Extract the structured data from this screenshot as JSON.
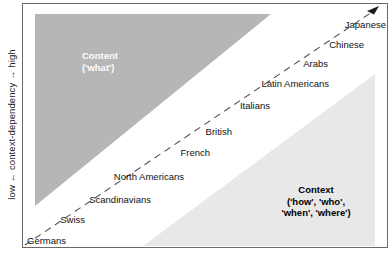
{
  "figure": {
    "y_axis_label": "low ← context-dependency → high",
    "arrow_icon": "arrow-up-right-icon"
  },
  "regions": [
    {
      "key": "content",
      "name": "content-region",
      "text": "Content\n('what')",
      "fill": "#b6b6b6",
      "text_color": "#ffffff"
    },
    {
      "key": "context",
      "name": "context-region",
      "text": "Context\n('how', 'who',\n'when', 'where')",
      "fill": "#e8e8e8",
      "text_color": "#000000"
    }
  ],
  "chart_data": {
    "type": "scatter",
    "title": "",
    "xlabel": "",
    "ylabel": "low ← context-dependency → high",
    "grid": false,
    "legend": "none",
    "series": [
      {
        "name": "cultures",
        "points": [
          {
            "label": "Germans",
            "x": 0.02,
            "y": 0.03
          },
          {
            "label": "Swiss",
            "x": 0.13,
            "y": 0.12
          },
          {
            "label": "Scandinavians",
            "x": 0.24,
            "y": 0.22
          },
          {
            "label": "North Americans",
            "x": 0.37,
            "y": 0.33
          },
          {
            "label": "French",
            "x": 0.49,
            "y": 0.43
          },
          {
            "label": "British",
            "x": 0.57,
            "y": 0.5
          },
          {
            "label": "Italians",
            "x": 0.66,
            "y": 0.6
          },
          {
            "label": "Latin Americans",
            "x": 0.76,
            "y": 0.7
          },
          {
            "label": "Arabs",
            "x": 0.84,
            "y": 0.79
          },
          {
            "label": "Chinese",
            "x": 0.9,
            "y": 0.86
          },
          {
            "label": "Japanese",
            "x": 0.96,
            "y": 0.93
          }
        ]
      }
    ]
  },
  "culture_points": [
    {
      "label": "Germans",
      "lx": 4,
      "ly": 236,
      "anchor": "left"
    },
    {
      "label": "Swiss",
      "lx": 62,
      "ly": 215,
      "anchor": "right"
    },
    {
      "label": "Scandinavians",
      "lx": 128,
      "ly": 195,
      "anchor": "right"
    },
    {
      "label": "North Americans",
      "lx": 161,
      "ly": 172,
      "anchor": "right"
    },
    {
      "label": "French",
      "lx": 187,
      "ly": 148,
      "anchor": "right"
    },
    {
      "label": "British",
      "lx": 209,
      "ly": 127,
      "anchor": "right"
    },
    {
      "label": "Italians",
      "lx": 247,
      "ly": 101,
      "anchor": "right"
    },
    {
      "label": "Latin Americans",
      "lx": 306,
      "ly": 79,
      "anchor": "right"
    },
    {
      "label": "Arabs",
      "lx": 305,
      "ly": 59,
      "anchor": "right"
    },
    {
      "label": "Chinese",
      "lx": 341,
      "ly": 40,
      "anchor": "right"
    },
    {
      "label": "Japanese",
      "lx": 363,
      "ly": 20,
      "anchor": "right"
    }
  ]
}
